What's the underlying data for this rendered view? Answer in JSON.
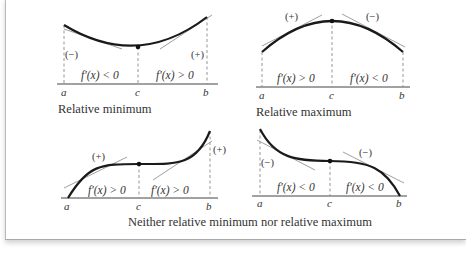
{
  "panels": [
    {
      "id": "relative-minimum",
      "caption": "Relative minimum",
      "axis_labels": {
        "a": "a",
        "c": "c",
        "b": "b"
      },
      "left_region": "f′(x) < 0",
      "right_region": "f′(x) > 0",
      "left_sign": "(−)",
      "right_sign": "(+)"
    },
    {
      "id": "relative-maximum",
      "caption": "Relative maximum",
      "axis_labels": {
        "a": "a",
        "c": "c",
        "b": "b"
      },
      "left_region": "f′(x) > 0",
      "right_region": "f′(x) < 0",
      "left_sign": "(+)",
      "right_sign": "(−)"
    },
    {
      "id": "increasing-inflection",
      "axis_labels": {
        "a": "a",
        "c": "c",
        "b": "b"
      },
      "left_region": "f′(x) > 0",
      "right_region": "f′(x) > 0",
      "left_sign": "(+)",
      "right_sign": "(+)"
    },
    {
      "id": "decreasing-inflection",
      "axis_labels": {
        "a": "a",
        "c": "c",
        "b": "b"
      },
      "left_region": "f′(x) < 0",
      "right_region": "f′(x) < 0",
      "left_sign": "(−)",
      "right_sign": "(−)"
    }
  ],
  "bottom_caption": "Neither relative minimum nor relative maximum",
  "colors": {
    "curve": "#1a1a1a",
    "tangent": "#a0a0a0",
    "axis": "#444444",
    "text": "#333333"
  }
}
